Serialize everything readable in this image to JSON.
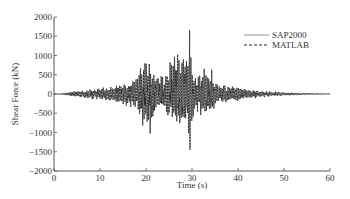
{
  "chart_data": {
    "type": "line",
    "title": "",
    "xlabel": "Time (s)",
    "ylabel": "Shear Force (kN)",
    "xlim": [
      0,
      60
    ],
    "ylim": [
      -2000,
      2000
    ],
    "xticks": [
      0,
      10,
      20,
      30,
      40,
      50,
      60
    ],
    "yticks": [
      2000,
      1500,
      1000,
      500,
      0,
      -500,
      -1000,
      -1500,
      -2000
    ],
    "grid": false,
    "legend_position": "top-right",
    "series": [
      {
        "name": "SAP2000",
        "style": "solid",
        "color": "#888888"
      },
      {
        "name": "MATLAB",
        "style": "dashed",
        "color": "#222222"
      }
    ],
    "envelope": {
      "description": "approximate amplitude envelope of the shear force time history (kN) at sample times (s)",
      "t": [
        0,
        2,
        5,
        8,
        10,
        12,
        14,
        16,
        18,
        19,
        20,
        21,
        22,
        23,
        24,
        25,
        26,
        27,
        28,
        29,
        29.5,
        30,
        31,
        32,
        33,
        34,
        35,
        36,
        38,
        40,
        42,
        45,
        50,
        55,
        60
      ],
      "max": [
        0,
        20,
        80,
        120,
        150,
        180,
        250,
        300,
        450,
        700,
        1000,
        900,
        500,
        400,
        500,
        800,
        950,
        1000,
        950,
        800,
        1650,
        700,
        500,
        600,
        800,
        650,
        400,
        250,
        200,
        200,
        120,
        80,
        40,
        20,
        10
      ],
      "min": [
        0,
        -20,
        -80,
        -120,
        -150,
        -180,
        -250,
        -300,
        -450,
        -700,
        -950,
        -1000,
        -500,
        -400,
        -500,
        -800,
        -900,
        -950,
        -900,
        -800,
        -1450,
        -650,
        -450,
        -550,
        -700,
        -550,
        -350,
        -250,
        -200,
        -200,
        -120,
        -80,
        -40,
        -20,
        -10
      ]
    }
  }
}
